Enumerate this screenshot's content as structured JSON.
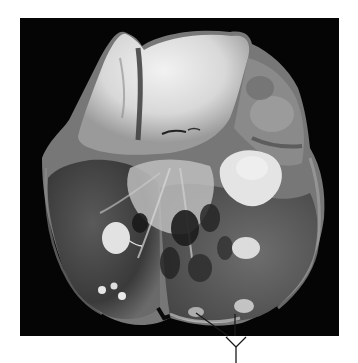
{
  "figure": {
    "background_color": "#050505",
    "page_background": "#ffffff",
    "annotation": {
      "type": "pointer-lines",
      "color": "#1a1a1a",
      "branches": 2,
      "label": ""
    }
  }
}
